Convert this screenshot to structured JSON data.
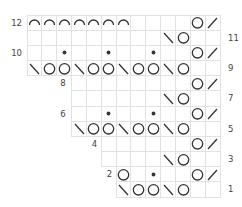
{
  "chart": {
    "columns": 13,
    "rows": 12,
    "grid_color": "#e2e2e2",
    "symbol_color": "#333333",
    "row_data": [
      {
        "row": 12,
        "start_col": 1,
        "label": "12",
        "label_side": "left",
        "cells": {
          "1": "arc",
          "2": "arc",
          "3": "arc",
          "4": "arc",
          "5": "arc",
          "6": "arc",
          "7": "arc",
          "12": "yo",
          "13": "k2tog"
        }
      },
      {
        "row": 11,
        "start_col": 1,
        "label": "11",
        "label_side": "right",
        "cells": {
          "10": "ssk",
          "11": "yo"
        }
      },
      {
        "row": 10,
        "start_col": 1,
        "label": "10",
        "label_side": "left",
        "cells": {
          "3": "dot",
          "6": "dot",
          "9": "dot",
          "12": "yo",
          "13": "k2tog"
        }
      },
      {
        "row": 9,
        "start_col": 1,
        "label": "9",
        "label_side": "right",
        "cells": {
          "1": "ssk",
          "2": "yo",
          "3": "yo",
          "4": "ssk",
          "5": "yo",
          "6": "yo",
          "7": "ssk",
          "8": "yo",
          "9": "yo",
          "10": "ssk",
          "11": "yo"
        }
      },
      {
        "row": 8,
        "start_col": 4,
        "label": "8",
        "label_side": "left",
        "cells": {
          "12": "yo",
          "13": "k2tog"
        }
      },
      {
        "row": 7,
        "start_col": 4,
        "label": "7",
        "label_side": "right",
        "cells": {
          "10": "ssk",
          "11": "yo"
        }
      },
      {
        "row": 6,
        "start_col": 4,
        "label": "6",
        "label_side": "left",
        "cells": {
          "6": "dot",
          "9": "dot",
          "12": "yo",
          "13": "k2tog"
        }
      },
      {
        "row": 5,
        "start_col": 4,
        "label": "5",
        "label_side": "right",
        "cells": {
          "4": "ssk",
          "5": "yo",
          "6": "yo",
          "7": "ssk",
          "8": "yo",
          "9": "yo",
          "10": "ssk",
          "11": "yo"
        }
      },
      {
        "row": 4,
        "start_col": 6,
        "label": "4",
        "label_side": "left",
        "cells": {
          "12": "yo",
          "13": "k2tog"
        }
      },
      {
        "row": 3,
        "start_col": 6,
        "label": "3",
        "label_side": "right",
        "cells": {
          "10": "ssk",
          "11": "yo"
        }
      },
      {
        "row": 2,
        "start_col": 7,
        "label": "2",
        "label_side": "left",
        "cells": {
          "7": "yo",
          "9": "dot",
          "12": "yo",
          "13": "k2tog"
        }
      },
      {
        "row": 1,
        "start_col": 7,
        "label": "1",
        "label_side": "right",
        "cells": {
          "7": "ssk",
          "8": "yo",
          "9": "yo",
          "10": "ssk",
          "11": "yo"
        }
      }
    ],
    "symbols": {
      "arc": "bind-off-arc-icon",
      "yo": "yarn-over-circle-icon",
      "k2tog": "k2tog-slash-icon",
      "ssk": "ssk-backslash-icon",
      "dot": "purl-dot-icon"
    }
  }
}
